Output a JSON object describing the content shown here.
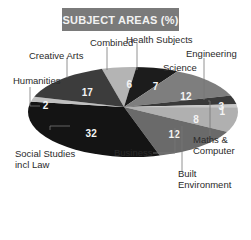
{
  "title": "SUBJECT AREAS (%)",
  "chart_data": {
    "type": "pie",
    "title": "SUBJECT AREAS (%)",
    "categories": [
      "Combined",
      "Health Subjects",
      "Science",
      "Engineering",
      "Built Environment",
      "Maths & Computer",
      "Business",
      "Social Studies incl Law",
      "Humanities",
      "Creative Arts"
    ],
    "values": [
      6,
      7,
      12,
      3,
      1,
      8,
      12,
      32,
      2,
      17
    ],
    "value_labels": [
      "6",
      "7",
      "12",
      "3",
      "1",
      "8",
      "12",
      "32",
      "2",
      "17"
    ],
    "colors": [
      "#b4b4b4",
      "#1c1c1c",
      "#7e7e7e",
      "#3a3a3a",
      "#c8c8c8",
      "#b0b0b0",
      "#6a6a6a",
      "#141414",
      "#c0c0c0",
      "#3c3c3c"
    ],
    "unit": "%",
    "legend_position": "leader-line labels around pie"
  },
  "labels": {
    "combined": "Combined",
    "health": "Health Subjects",
    "engineering": "Engineering",
    "science": "Science",
    "creative": "Creative Arts",
    "humanities": "Humanities",
    "maths_l1": "Maths &",
    "maths_l2": "Computer",
    "social_l1": "Social Studies",
    "social_l2": "incl Law",
    "business": "Business",
    "built_l1": "Built",
    "built_l2": "Environment"
  }
}
